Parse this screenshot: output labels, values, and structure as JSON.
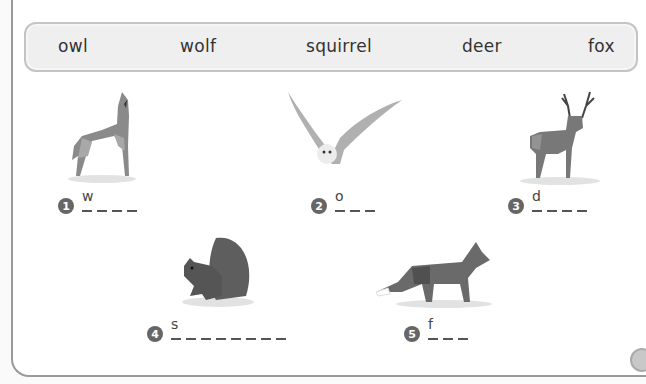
{
  "word_bank": {
    "words": [
      "owl",
      "wolf",
      "squirrel",
      "deer",
      "fox"
    ]
  },
  "exercises": [
    {
      "number": "1",
      "animal": "wolf",
      "first_letter": "w",
      "blank_count": 4
    },
    {
      "number": "2",
      "animal": "owl",
      "first_letter": "o",
      "blank_count": 3
    },
    {
      "number": "3",
      "animal": "deer",
      "first_letter": "d",
      "blank_count": 4
    },
    {
      "number": "4",
      "animal": "squirrel",
      "first_letter": "s",
      "blank_count": 8
    },
    {
      "number": "5",
      "animal": "fox",
      "first_letter": "f",
      "blank_count": 3
    }
  ],
  "audio_button": {
    "icon": "speaker-icon"
  },
  "colors": {
    "wordbank_bg": "#efefef",
    "wordbank_border": "#c4c4c4",
    "number_badge": "#666666",
    "animal_gray": "#7a7a7a"
  }
}
